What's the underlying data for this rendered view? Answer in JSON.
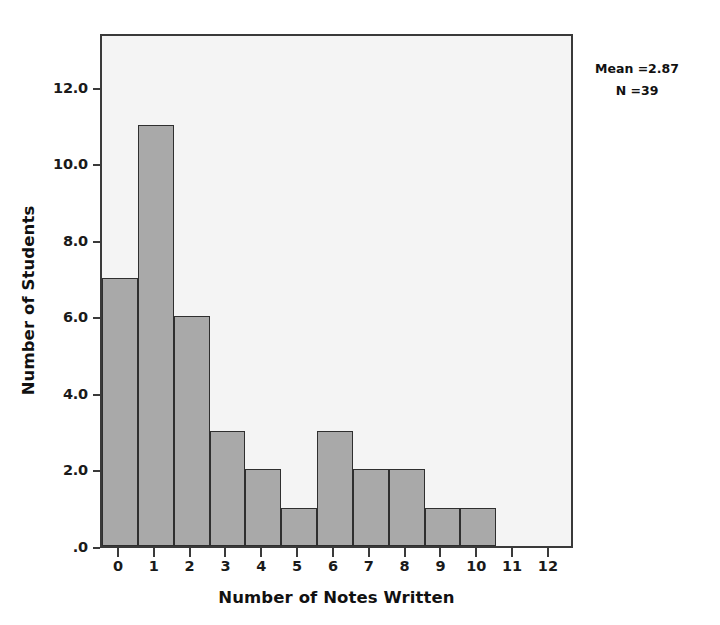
{
  "chart_data": {
    "type": "bar",
    "title": "",
    "xlabel": "Number of Notes Written",
    "ylabel": "Number of Students",
    "categories": [
      "0",
      "1",
      "2",
      "3",
      "4",
      "5",
      "6",
      "7",
      "8",
      "9",
      "10"
    ],
    "values": [
      7,
      11,
      6,
      3,
      2,
      1,
      3,
      2,
      2,
      1,
      1
    ],
    "x_tick_labels": [
      "0",
      "1",
      "2",
      "3",
      "4",
      "5",
      "6",
      "7",
      "8",
      "9",
      "10",
      "11",
      "12"
    ],
    "x_tick_values": [
      0,
      1,
      2,
      3,
      4,
      5,
      6,
      7,
      8,
      9,
      10,
      11,
      12
    ],
    "y_tick_labels": [
      ".0",
      "2.0",
      "4.0",
      "6.0",
      "8.0",
      "10.0",
      "12.0"
    ],
    "y_tick_values": [
      0,
      2,
      4,
      6,
      8,
      10,
      12
    ],
    "xlim": [
      -0.5,
      12.5
    ],
    "ylim": [
      0,
      13.4
    ],
    "grid": false,
    "legend": null,
    "bar_fill_color": "#a9a9a9",
    "bar_edge_color": "#2f2f2f",
    "plot_background_color": "#f4f4f4",
    "frame_color": "#3a3a3a",
    "annotations": [
      {
        "label": "Mean =2.87"
      },
      {
        "label": "N =39"
      }
    ]
  }
}
